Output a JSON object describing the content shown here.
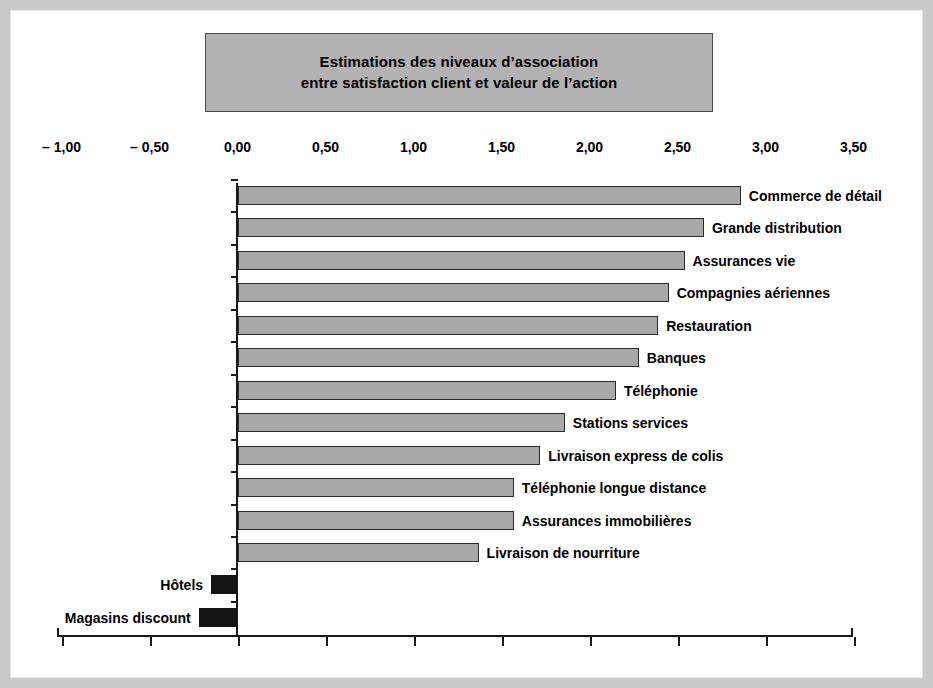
{
  "figure": {
    "title_line1": "Estimations des niveaux d’association",
    "title_line2": "entre satisfaction client et valeur de l’action",
    "bar_color_positive": "#a8a8a8",
    "bar_color_negative": "#141414",
    "title_box_color": "#b2b2b2",
    "frame_color": "#c9c9c9"
  },
  "chart_data": {
    "type": "bar",
    "orientation": "horizontal",
    "title": "Estimations des niveaux d’association entre satisfaction client et valeur de l’action",
    "xlabel": "",
    "ylabel": "",
    "xlim": [
      -1.0,
      3.5
    ],
    "grid": false,
    "legend": null,
    "tick_labels": [
      "– 1,00",
      "– 0,50",
      "0,00",
      "0,50",
      "1,00",
      "1,50",
      "2,00",
      "2,50",
      "3,00",
      "3,50"
    ],
    "ticks": [
      -1.0,
      -0.5,
      0.0,
      0.5,
      1.0,
      1.5,
      2.0,
      2.5,
      3.0,
      3.5
    ],
    "categories": [
      "Commerce de détail",
      "Grande distribution",
      "Assurances vie",
      "Compagnies aériennes",
      "Restauration",
      "Banques",
      "Téléphonie",
      "Stations services",
      "Livraison express de colis",
      "Téléphonie longue distance",
      "Assurances immobilières",
      "Livraison de nourriture",
      "Hôtels",
      "Magasins discount"
    ],
    "values": [
      2.86,
      2.65,
      2.54,
      2.45,
      2.39,
      2.28,
      2.15,
      1.86,
      1.72,
      1.57,
      1.57,
      1.37,
      -0.15,
      -0.22
    ]
  }
}
